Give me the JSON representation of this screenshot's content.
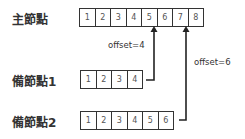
{
  "primary": {
    "label": "主節點",
    "cells": [
      "1",
      "2",
      "3",
      "4",
      "5",
      "6",
      "7",
      "8"
    ]
  },
  "secondary1": {
    "label": "備節點1",
    "cells": [
      "1",
      "2",
      "3",
      "4"
    ],
    "offset_label": "offset=4"
  },
  "secondary2": {
    "label": "備節點2",
    "cells": [
      "1",
      "2",
      "3",
      "4",
      "5",
      "6"
    ],
    "offset_label": "offset=6"
  },
  "colors": {
    "line": "#222222",
    "text": "#333333"
  }
}
